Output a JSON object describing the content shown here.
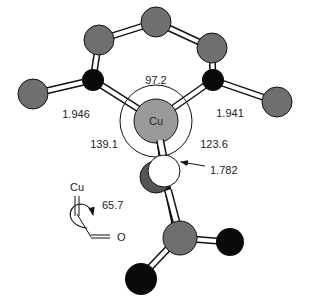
{
  "diagram": {
    "type": "molecular-structure",
    "colors": {
      "carbon": "#6f6f6f",
      "nitrogen": "#0a0a0a",
      "oxygen_dark": "#0a0a0a",
      "copper": "#9a9a9a",
      "oxygen_white": "#ffffff",
      "bond_fill": "#ffffff",
      "stroke": "#111111"
    },
    "center_atom": {
      "label": "Cu"
    },
    "distances": {
      "cu_n_left": "1.946",
      "cu_n_right": "1.941",
      "cu_o": "1.782"
    },
    "angles": {
      "n_cu_n": "97.2",
      "n_left_cu_o": "139.1",
      "n_right_cu_o": "123.6"
    },
    "inset": {
      "cu_label": "Cu",
      "o_label": "O",
      "torsion_angle": "65.7"
    }
  }
}
